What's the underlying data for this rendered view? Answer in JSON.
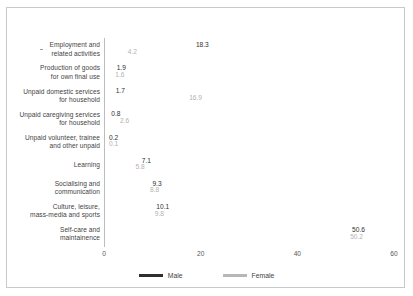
{
  "chart_data": {
    "type": "bar",
    "orientation": "horizontal",
    "title": "",
    "xlabel": "",
    "ylabel": "",
    "xlim": [
      0,
      60
    ],
    "xticks": [
      "0",
      "20",
      "40",
      "60"
    ],
    "grid": false,
    "legend_position": "bottom",
    "categories": [
      "Employment and\nrelated activities",
      "Production of goods\nfor own final use",
      "Unpaid domestic services\nfor household",
      "Unpaid caregiving services\nfor household",
      "Unpaid volunteer, trainee\nand other unpaid",
      "Learning",
      "Socialising and\ncommunication",
      "Culture, leisure,\nmass-media and sports",
      "Self-care and\nmaintainence"
    ],
    "series": [
      {
        "name": "Male",
        "color": "#3a3a3a",
        "values": [
          18.3,
          1.9,
          1.7,
          0.8,
          0.2,
          7.1,
          9.3,
          10.1,
          50.6
        ],
        "labels": [
          "18.3",
          "1.9",
          "1.7",
          "0.8",
          "0.2",
          "7.1",
          "9.3",
          "10.1",
          "50.6"
        ]
      },
      {
        "name": "Female",
        "color": "#b7b7b7",
        "values": [
          4.2,
          1.6,
          16.9,
          2.6,
          0.1,
          5.8,
          8.8,
          9.8,
          50.2
        ],
        "labels": [
          "4.2",
          "1.6",
          "16.9",
          "2.6",
          "0.1",
          "5.8",
          "8.8",
          "9.8",
          "50.2"
        ]
      }
    ]
  },
  "legend": {
    "items": [
      {
        "label": "Male"
      },
      {
        "label": "Female"
      }
    ]
  }
}
